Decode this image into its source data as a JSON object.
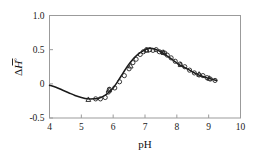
{
  "figure": {
    "name": "ph-enthalpy-plot",
    "background_color": "#ffffff",
    "frame_color": "#9b9b9b",
    "curve_color": "#1a1a1a",
    "marker_color": "#222222"
  },
  "chart_data": {
    "type": "scatter",
    "title": "",
    "subtitle": "",
    "xlabel": "pH",
    "ylabel": "ΔH°",
    "ylabel_parts": {
      "delta": "Δ",
      "symbol": "H",
      "overbar": true,
      "superscript": "°"
    },
    "xlim": [
      4,
      10
    ],
    "ylim": [
      -0.5,
      1.0
    ],
    "xticks": [
      4,
      5,
      6,
      7,
      8,
      9,
      10
    ],
    "xtick_labels": [
      "4",
      "5",
      "6",
      "7",
      "8",
      "9",
      "10"
    ],
    "yticks": [
      -0.5,
      0,
      0.5,
      1.0
    ],
    "ytick_labels": [
      "-0.5",
      "0",
      "0.5",
      "1.0"
    ],
    "grid": false,
    "legend": null,
    "legend_position": "none",
    "series": [
      {
        "name": "fitted-curve",
        "type": "line",
        "marker": "none",
        "x": [
          4.0,
          4.2,
          4.4,
          4.6,
          4.8,
          5.0,
          5.2,
          5.4,
          5.55,
          5.7,
          5.85,
          6.0,
          6.15,
          6.3,
          6.45,
          6.6,
          6.75,
          6.9,
          7.05,
          7.15,
          7.3,
          7.45,
          7.6,
          7.75,
          7.9,
          8.05,
          8.2,
          8.4,
          8.6,
          8.8,
          9.0,
          9.25
        ],
        "y": [
          -0.02,
          -0.05,
          -0.09,
          -0.13,
          -0.17,
          -0.2,
          -0.22,
          -0.22,
          -0.21,
          -0.18,
          -0.13,
          -0.06,
          0.04,
          0.15,
          0.26,
          0.35,
          0.42,
          0.47,
          0.51,
          0.52,
          0.51,
          0.48,
          0.44,
          0.39,
          0.34,
          0.29,
          0.25,
          0.2,
          0.15,
          0.11,
          0.08,
          0.05
        ]
      },
      {
        "name": "data-circles",
        "type": "scatter",
        "marker": "open-circle",
        "x": [
          5.45,
          5.6,
          5.75,
          5.85,
          5.88,
          6.05,
          6.2,
          6.35,
          6.5,
          6.62,
          6.72,
          6.85,
          6.95,
          7.05,
          7.15,
          7.25,
          7.35,
          7.45,
          7.55,
          7.62,
          7.7,
          7.82,
          7.95,
          8.1,
          8.25,
          8.4,
          8.55,
          8.7,
          8.82,
          8.95,
          9.05,
          9.2
        ],
        "y": [
          -0.22,
          -0.22,
          -0.2,
          -0.12,
          -0.08,
          -0.06,
          0.03,
          0.12,
          0.22,
          0.31,
          0.36,
          0.43,
          0.47,
          0.5,
          0.5,
          0.49,
          0.5,
          0.47,
          0.46,
          0.45,
          0.42,
          0.38,
          0.33,
          0.29,
          0.25,
          0.2,
          0.16,
          0.13,
          0.12,
          0.09,
          0.07,
          0.05
        ]
      },
      {
        "name": "data-triangles",
        "type": "scatter",
        "marker": "open-triangle",
        "x": [
          5.22,
          5.88,
          6.55,
          7.05,
          7.58,
          8.12,
          8.7,
          9.02
        ],
        "y": [
          -0.23,
          -0.09,
          0.26,
          0.49,
          0.46,
          0.28,
          0.14,
          0.08
        ]
      }
    ]
  }
}
